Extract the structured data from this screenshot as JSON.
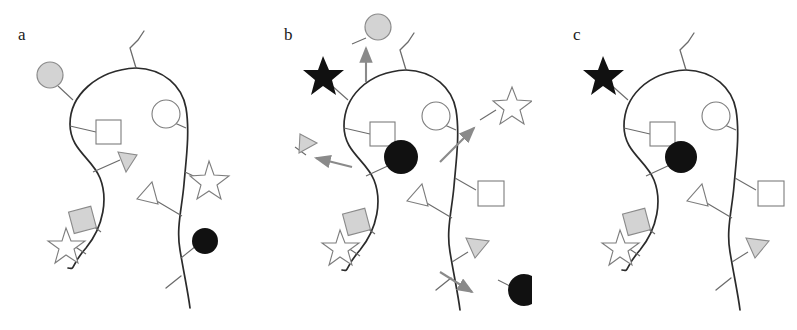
{
  "figure": {
    "type": "schematic-diagram",
    "background_color": "#ffffff",
    "outline_color": "#2b2b2b",
    "connector_color": "#6b6b6b",
    "arrow_color": "#8a8a8a"
  },
  "palette": {
    "gray_fill": "#d3d3d3",
    "gray_stroke": "#8a8a8a",
    "black_fill": "#111111",
    "white_fill": "#ffffff",
    "white_stroke": "#7d7d7d",
    "curve_stroke": "#2b2b2b"
  },
  "panels": [
    {
      "id": "a",
      "label": "a",
      "markers": [
        {
          "name": "gray-circle",
          "shape": "circle",
          "fill": "gray",
          "position": "upper-left-outside"
        },
        {
          "name": "white-square",
          "shape": "square",
          "fill": "white",
          "position": "upper-left-inside"
        },
        {
          "name": "white-circle",
          "shape": "circle",
          "fill": "white",
          "position": "upper-right-inside"
        },
        {
          "name": "gray-triangle",
          "shape": "triangle",
          "fill": "gray",
          "position": "center-left-inside"
        },
        {
          "name": "white-triangle",
          "shape": "triangle",
          "fill": "white",
          "position": "center-inside"
        },
        {
          "name": "white-star",
          "shape": "star",
          "fill": "white",
          "position": "middle-right-outside"
        },
        {
          "name": "gray-square",
          "shape": "square",
          "fill": "gray",
          "position": "lower-left-outside"
        },
        {
          "name": "white-star-2",
          "shape": "star",
          "fill": "white",
          "position": "lower-left-outside"
        },
        {
          "name": "black-circle",
          "shape": "circle",
          "fill": "black",
          "position": "lower-right-outside"
        }
      ],
      "arrows": []
    },
    {
      "id": "b",
      "label": "b",
      "markers": [
        {
          "name": "gray-circle",
          "shape": "circle",
          "fill": "gray",
          "position": "top-detached"
        },
        {
          "name": "black-star",
          "shape": "star",
          "fill": "black",
          "position": "upper-left-outside"
        },
        {
          "name": "white-square",
          "shape": "square",
          "fill": "white",
          "position": "upper-left-inside"
        },
        {
          "name": "white-circle",
          "shape": "circle",
          "fill": "white",
          "position": "upper-right-inside"
        },
        {
          "name": "gray-triangle",
          "shape": "triangle",
          "fill": "gray",
          "position": "left-detached"
        },
        {
          "name": "black-circle",
          "shape": "circle",
          "fill": "black",
          "position": "center-inside"
        },
        {
          "name": "white-star",
          "shape": "star",
          "fill": "white",
          "position": "right-detached"
        },
        {
          "name": "white-square-2",
          "shape": "square",
          "fill": "white",
          "position": "middle-right-outside"
        },
        {
          "name": "white-triangle",
          "shape": "triangle",
          "fill": "white",
          "position": "center-inside"
        },
        {
          "name": "gray-square",
          "shape": "square",
          "fill": "gray",
          "position": "lower-left-outside"
        },
        {
          "name": "white-star-2",
          "shape": "star",
          "fill": "white",
          "position": "lower-left-outside"
        },
        {
          "name": "gray-triangle-2",
          "shape": "triangle",
          "fill": "gray",
          "position": "lower-right-outside"
        },
        {
          "name": "black-circle-2",
          "shape": "circle",
          "fill": "black",
          "position": "bottom-right-detached"
        }
      ],
      "arrows": [
        {
          "name": "arrow-up",
          "direction": "up",
          "meaning": "gray circle leaving"
        },
        {
          "name": "arrow-left",
          "direction": "left",
          "meaning": "gray triangle leaving"
        },
        {
          "name": "arrow-up-right",
          "direction": "up-right",
          "meaning": "white star leaving"
        },
        {
          "name": "arrow-down-right",
          "direction": "down-right",
          "meaning": "black circle leaving"
        }
      ]
    },
    {
      "id": "c",
      "label": "c",
      "markers": [
        {
          "name": "black-star",
          "shape": "star",
          "fill": "black",
          "position": "upper-left-outside"
        },
        {
          "name": "white-square",
          "shape": "square",
          "fill": "white",
          "position": "upper-left-inside"
        },
        {
          "name": "white-circle",
          "shape": "circle",
          "fill": "white",
          "position": "upper-right-inside"
        },
        {
          "name": "black-circle",
          "shape": "circle",
          "fill": "black",
          "position": "center-left-inside"
        },
        {
          "name": "white-triangle",
          "shape": "triangle",
          "fill": "white",
          "position": "center-inside"
        },
        {
          "name": "white-square-2",
          "shape": "square",
          "fill": "white",
          "position": "middle-right-outside"
        },
        {
          "name": "gray-square",
          "shape": "square",
          "fill": "gray",
          "position": "lower-left-outside"
        },
        {
          "name": "white-star",
          "shape": "star",
          "fill": "white",
          "position": "lower-left-outside"
        },
        {
          "name": "gray-triangle",
          "shape": "triangle",
          "fill": "gray",
          "position": "lower-right-outside"
        }
      ],
      "arrows": []
    }
  ]
}
